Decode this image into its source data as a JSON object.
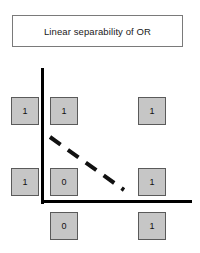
{
  "figure": {
    "title": "Linear separability of OR",
    "colors": {
      "cell_fill": "#c6c6c6",
      "cell_border": "#5a5a5a",
      "axis": "#000000",
      "separator": "#111111",
      "title_border": "#7a7a7a",
      "background": "#ffffff"
    },
    "axes": {
      "y_axis_name": "y-axis",
      "x_axis_name": "x-axis"
    },
    "separator": {
      "name": "separating-line",
      "style": "dashed",
      "from": [
        50,
        137
      ],
      "to": [
        124,
        190
      ]
    },
    "cells": [
      {
        "id": "y-label-top",
        "value": "1",
        "x": 11,
        "y": 97
      },
      {
        "id": "point-0-1",
        "value": "1",
        "x": 50,
        "y": 97
      },
      {
        "id": "point-1-1",
        "value": "1",
        "x": 138,
        "y": 97
      },
      {
        "id": "y-label-bottom",
        "value": "1",
        "x": 11,
        "y": 168
      },
      {
        "id": "point-0-0",
        "value": "0",
        "x": 50,
        "y": 168
      },
      {
        "id": "point-1-0",
        "value": "1",
        "x": 138,
        "y": 168
      },
      {
        "id": "x-label-left",
        "value": "0",
        "x": 50,
        "y": 212
      },
      {
        "id": "x-label-right",
        "value": "1",
        "x": 138,
        "y": 212
      }
    ]
  }
}
